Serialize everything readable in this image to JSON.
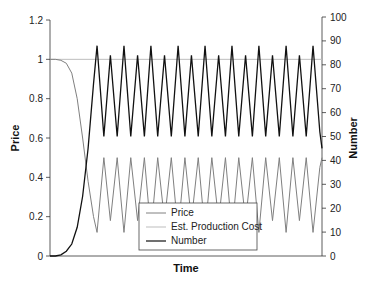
{
  "chart_data": {
    "type": "line",
    "title": "",
    "xlabel": "Time",
    "ylabel": "Price",
    "y2label": "Number",
    "xlim": [
      0,
      100
    ],
    "ylim": [
      0,
      1.2
    ],
    "y2lim": [
      0,
      100
    ],
    "yticks": [
      "0",
      "0.2",
      "0.4",
      "0.6",
      "0.8",
      "1",
      "1.2"
    ],
    "y2ticks": [
      "0",
      "10",
      "20",
      "30",
      "40",
      "50",
      "60",
      "70",
      "80",
      "90",
      "100"
    ],
    "grid": false,
    "legend_position": "bottom-center",
    "series": [
      {
        "name": "Price",
        "axis": "left",
        "color": "#808080",
        "x": [
          0,
          2,
          4,
          6,
          8,
          10,
          12,
          14,
          16,
          17.3,
          19.8,
          22.2,
          24.7,
          27.2,
          29.7,
          32.2,
          34.7,
          37.1,
          39.6,
          42.1,
          44.6,
          47.1,
          49.6,
          52.0,
          54.5,
          57.0,
          59.5,
          62.0,
          64.5,
          66.9,
          69.4,
          71.9,
          74.4,
          76.8,
          79.3,
          81.8,
          84.3,
          86.8,
          89.3,
          91.7,
          94.2,
          96.7,
          99.2,
          100
        ],
        "values": [
          1.0,
          1.0,
          0.995,
          0.98,
          0.93,
          0.8,
          0.6,
          0.38,
          0.2,
          0.12,
          0.5,
          0.18,
          0.5,
          0.12,
          0.5,
          0.18,
          0.5,
          0.12,
          0.5,
          0.18,
          0.5,
          0.12,
          0.5,
          0.18,
          0.5,
          0.12,
          0.5,
          0.18,
          0.5,
          0.12,
          0.5,
          0.18,
          0.5,
          0.12,
          0.5,
          0.18,
          0.5,
          0.12,
          0.5,
          0.18,
          0.5,
          0.12,
          0.45,
          0.5
        ]
      },
      {
        "name": "Est. Production Cost",
        "axis": "left",
        "color": "#bdbdbd",
        "x": [
          0,
          100
        ],
        "values": [
          1.0,
          1.0
        ]
      },
      {
        "name": "Number",
        "axis": "right",
        "color": "#111111",
        "x": [
          0,
          2,
          4,
          6,
          8,
          10,
          12,
          14,
          16,
          17.3,
          19.8,
          22.2,
          24.7,
          27.2,
          29.7,
          32.2,
          34.7,
          37.1,
          39.6,
          42.1,
          44.6,
          47.1,
          49.6,
          52.0,
          54.5,
          57.0,
          59.5,
          62.0,
          64.5,
          66.9,
          69.4,
          71.9,
          74.4,
          76.8,
          79.3,
          81.8,
          84.3,
          86.8,
          89.3,
          91.7,
          94.2,
          96.7,
          99.2,
          100
        ],
        "values": [
          0,
          0,
          0.5,
          2,
          5,
          12,
          25,
          45,
          72,
          88,
          50,
          84,
          50,
          88,
          50,
          84,
          50,
          88,
          50,
          84,
          50,
          88,
          50,
          84,
          50,
          88,
          50,
          84,
          50,
          88,
          50,
          84,
          50,
          88,
          50,
          84,
          50,
          88,
          50,
          84,
          50,
          88,
          52,
          45
        ]
      }
    ]
  }
}
